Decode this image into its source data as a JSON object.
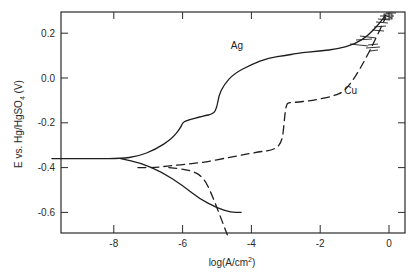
{
  "chart_data": {
    "type": "line",
    "title": "",
    "xlabel": "log(A/cm²)",
    "xlabel_parts": {
      "base": "log(A/cm",
      "sup": "2",
      "end": ")"
    },
    "ylabel": "E vs. Hg/HgSO₄ (V)",
    "ylabel_parts": {
      "base": "E vs. Hg/HgSO",
      "sub": "4",
      "end": " (V)"
    },
    "xlim": [
      -9.8,
      0.45
    ],
    "ylim": [
      -0.7,
      0.3
    ],
    "xticks": [
      -8,
      -6,
      -4,
      -2,
      0
    ],
    "xtick_labels": [
      "-8",
      "-6",
      "-4",
      "-2",
      "0"
    ],
    "yticks": [
      0.2,
      0.0,
      -0.2,
      -0.4,
      -0.6
    ],
    "ytick_labels": [
      "0.2",
      "0.0",
      "-0.2",
      "-0.4",
      "-0.6"
    ],
    "grid": false,
    "legend": "none (curves labeled inline)",
    "annotations": [
      {
        "text": "Ag",
        "x": -4.6,
        "y": 0.13
      },
      {
        "text": "Cu",
        "x": -1.3,
        "y": -0.07
      }
    ],
    "series": [
      {
        "name": "Ag anodic",
        "style": "solid",
        "x": [
          -9.8,
          -8.5,
          -7.8,
          -7.3,
          -6.8,
          -6.3,
          -6.05,
          -6.0,
          -5.9,
          -5.4,
          -5.1,
          -5.0,
          -4.95,
          -4.8,
          -4.5,
          -4.0,
          -3.5,
          -3.0,
          -2.7,
          -2.0,
          -1.5,
          -1.0,
          -0.6,
          -0.3,
          -0.1
        ],
        "y": [
          -0.36,
          -0.36,
          -0.36,
          -0.35,
          -0.32,
          -0.27,
          -0.22,
          -0.2,
          -0.19,
          -0.17,
          -0.16,
          -0.13,
          -0.08,
          -0.03,
          0.02,
          0.06,
          0.09,
          0.1,
          0.11,
          0.12,
          0.13,
          0.15,
          0.19,
          0.24,
          0.28
        ]
      },
      {
        "name": "Ag cathodic",
        "style": "solid",
        "x": [
          -7.8,
          -7.2,
          -6.6,
          -6.0,
          -5.5,
          -5.0,
          -4.6,
          -4.3
        ],
        "y": [
          -0.36,
          -0.38,
          -0.42,
          -0.48,
          -0.54,
          -0.58,
          -0.6,
          -0.6
        ]
      },
      {
        "name": "Cu anodic",
        "style": "dashed",
        "x": [
          -7.3,
          -6.8,
          -6.3,
          -5.5,
          -4.5,
          -3.8,
          -3.3,
          -3.1,
          -3.05,
          -3.0,
          -2.95,
          -2.8,
          -2.2,
          -1.6,
          -1.3,
          -1.0,
          -0.7,
          -0.4,
          -0.1
        ],
        "y": [
          -0.4,
          -0.4,
          -0.39,
          -0.38,
          -0.35,
          -0.33,
          -0.32,
          -0.28,
          -0.2,
          -0.13,
          -0.11,
          -0.11,
          -0.1,
          -0.08,
          -0.06,
          0.0,
          0.08,
          0.17,
          0.27
        ]
      },
      {
        "name": "Cu cathodic",
        "style": "dashed",
        "x": [
          -6.4,
          -5.8,
          -5.4,
          -5.15,
          -5.0,
          -4.85,
          -4.7
        ],
        "y": [
          -0.4,
          -0.41,
          -0.44,
          -0.52,
          -0.58,
          -0.64,
          -0.7
        ]
      }
    ]
  }
}
